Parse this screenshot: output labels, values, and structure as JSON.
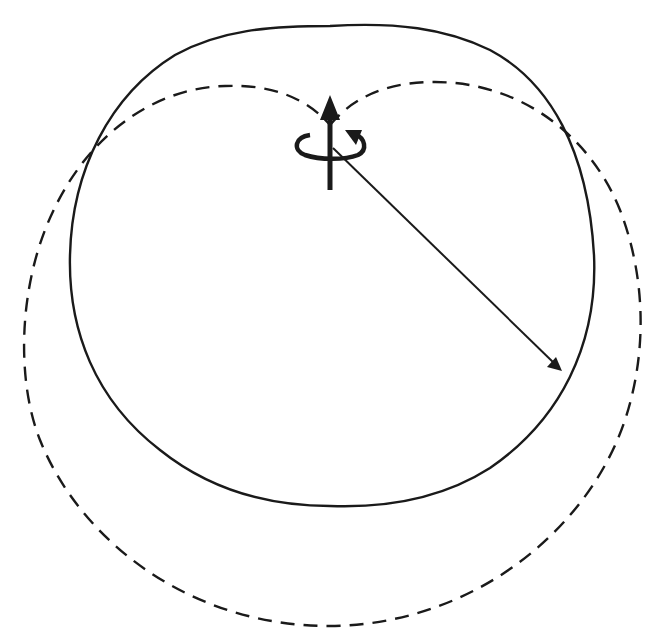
{
  "diagram": {
    "title": "Radiation pattern of a spinning dipole/axis with rotating vector",
    "colors": {
      "stroke": "#1a1a1a",
      "background": "#ffffff"
    },
    "elements": {
      "solid_curve": "solid pattern curve (near-circular, flattened top)",
      "dashed_curve": "dashed pattern curve (two lobes meeting at axis)",
      "axis_arrow": "vertical up arrow",
      "rotation_arrow": "circular rotation arrow around axis",
      "radius_arrow": "radial vector arrow to lower right"
    }
  }
}
